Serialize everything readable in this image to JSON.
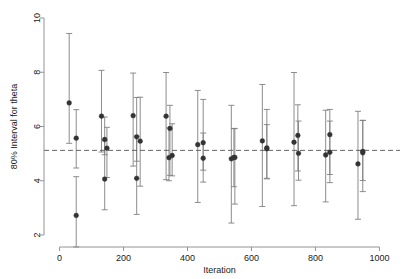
{
  "chart_data": {
    "type": "scatter",
    "title": "",
    "xlabel": "Iteration",
    "ylabel": "80% Interval for theta",
    "xlim": [
      -30,
      1030
    ],
    "ylim": [
      1.2,
      10.4
    ],
    "xticks": [
      0,
      200,
      400,
      600,
      800,
      1000
    ],
    "yticks": [
      2,
      4,
      6,
      8,
      10
    ],
    "xtick_labels": [
      "0",
      "200",
      "400",
      "600",
      "800",
      "1000"
    ],
    "ytick_labels": [
      "2",
      "4",
      "6",
      "8",
      "10"
    ],
    "grid": false,
    "legend": false,
    "marker_color": "#333333",
    "errorbar_color": "#808080",
    "refline_color": "#555555",
    "axis_color": "#888888",
    "reference_line": {
      "value": 5.12,
      "style": "dashed",
      "orientation": "horizontal"
    },
    "series": [
      {
        "name": "80% interval for theta",
        "points": [
          {
            "x": 30,
            "y": 6.87,
            "low": 5.38,
            "high": 9.43
          },
          {
            "x": 52,
            "y": 5.57,
            "low": 4.47,
            "high": 6.62
          },
          {
            "x": 52,
            "y": 2.72,
            "low": 1.56,
            "high": 4.15
          },
          {
            "x": 131,
            "y": 6.38,
            "low": 5.06,
            "high": 8.07
          },
          {
            "x": 141,
            "y": 5.52,
            "low": 4.96,
            "high": 6.35
          },
          {
            "x": 148,
            "y": 5.2,
            "low": 4.12,
            "high": 5.97
          },
          {
            "x": 141,
            "y": 4.06,
            "low": 2.93,
            "high": 5.49
          },
          {
            "x": 230,
            "y": 6.4,
            "low": 4.54,
            "high": 7.97
          },
          {
            "x": 241,
            "y": 5.62,
            "low": 4.72,
            "high": 7.07
          },
          {
            "x": 252,
            "y": 5.46,
            "low": 3.8,
            "high": 7.08
          },
          {
            "x": 241,
            "y": 4.09,
            "low": 2.76,
            "high": 5.64
          },
          {
            "x": 333,
            "y": 6.38,
            "low": 4.04,
            "high": 7.99
          },
          {
            "x": 345,
            "y": 5.93,
            "low": 4.2,
            "high": 6.78
          },
          {
            "x": 342,
            "y": 4.85,
            "low": 4.0,
            "high": 5.95
          },
          {
            "x": 352,
            "y": 4.93,
            "low": 4.18,
            "high": 6.1
          },
          {
            "x": 432,
            "y": 5.33,
            "low": 3.2,
            "high": 7.33
          },
          {
            "x": 449,
            "y": 5.4,
            "low": 3.95,
            "high": 7.0
          },
          {
            "x": 449,
            "y": 4.83,
            "low": 4.39,
            "high": 5.76
          },
          {
            "x": 537,
            "y": 4.81,
            "low": 2.44,
            "high": 6.78
          },
          {
            "x": 548,
            "y": 4.86,
            "low": 3.14,
            "high": 5.93
          },
          {
            "x": 545,
            "y": 4.86,
            "low": 3.78,
            "high": 5.92
          },
          {
            "x": 634,
            "y": 5.47,
            "low": 3.05,
            "high": 7.55
          },
          {
            "x": 648,
            "y": 5.18,
            "low": 4.07,
            "high": 6.07
          },
          {
            "x": 648,
            "y": 5.21,
            "low": 4.09,
            "high": 6.63
          },
          {
            "x": 733,
            "y": 5.42,
            "low": 3.08,
            "high": 7.99
          },
          {
            "x": 745,
            "y": 5.67,
            "low": 4.36,
            "high": 6.8
          },
          {
            "x": 747,
            "y": 5.01,
            "low": 4.02,
            "high": 6.2
          },
          {
            "x": 832,
            "y": 4.95,
            "low": 3.22,
            "high": 6.6
          },
          {
            "x": 845,
            "y": 5.7,
            "low": 3.93,
            "high": 6.63
          },
          {
            "x": 845,
            "y": 5.05,
            "low": 4.23,
            "high": 6.2
          },
          {
            "x": 933,
            "y": 4.62,
            "low": 2.58,
            "high": 6.56
          },
          {
            "x": 948,
            "y": 5.03,
            "low": 3.6,
            "high": 6.23
          },
          {
            "x": 948,
            "y": 5.08,
            "low": 4.01,
            "high": 6.22
          }
        ]
      }
    ]
  },
  "axes": {
    "x_title": "Iteration",
    "y_title": "80% Interval for theta"
  }
}
